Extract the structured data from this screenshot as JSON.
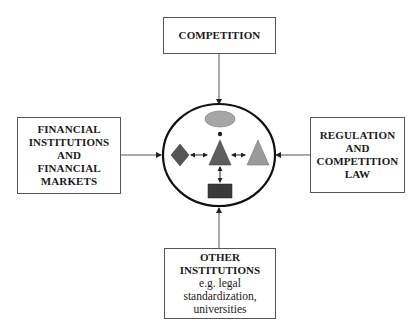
{
  "diagram": {
    "boxes": {
      "top": {
        "lines": [
          "COMPETITION"
        ]
      },
      "left": {
        "lines": [
          "FINANCIAL",
          "INSTITUTIONS",
          "AND",
          "FINANCIAL",
          "MARKETS"
        ]
      },
      "right": {
        "lines": [
          "REGULATION",
          "AND",
          "COMPETITION",
          "LAW"
        ]
      },
      "bottom": {
        "bold_lines": [
          "OTHER",
          "INSTITUTIONS"
        ],
        "lines": [
          "e.g. legal",
          "standardization,",
          "universities"
        ]
      }
    },
    "center": {
      "shape": "ellipse",
      "contents": [
        "grey-ellipse",
        "dark-diamond",
        "dark-triangle",
        "light-triangle",
        "dark-rectangle"
      ],
      "colors": {
        "ellipse_fill": "#a6a6a6",
        "diamond_fill": "#555555",
        "center_triangle_fill": "#5e5e5e",
        "right_triangle_fill": "#9a9a9a",
        "rect_fill": "#3a3a3a"
      }
    },
    "arrows": [
      "top-to-center",
      "left-to-center",
      "right-to-center",
      "bottom-to-center"
    ]
  }
}
